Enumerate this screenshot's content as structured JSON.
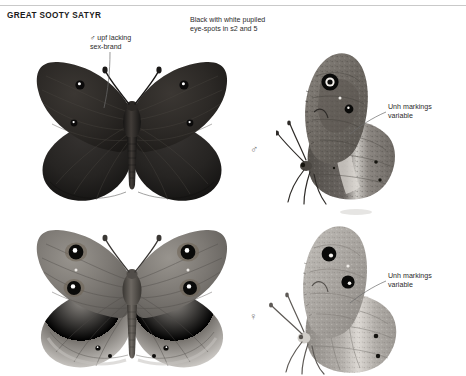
{
  "plate": {
    "title": "GREAT SOOTY SATYR",
    "background_color": "#ffffff",
    "rule_color": "#c9c9c9"
  },
  "annotations": [
    {
      "id": "upperside-eyespots",
      "text": "Black with white pupiled\neye-spots in s2 and 5",
      "has_leader": false
    },
    {
      "id": "sex-brand",
      "text": "♂ upf lacking\nsex-brand",
      "has_leader": true
    },
    {
      "id": "unh-variable-male",
      "text": "Unh markings\nvariable",
      "has_leader": true
    },
    {
      "id": "unh-variable-female",
      "text": "Unh markings\nvariable",
      "has_leader": true
    }
  ],
  "symbols": {
    "male": "♂",
    "female": "♀"
  },
  "specimens": [
    {
      "id": "male-upperside",
      "sex": "male",
      "view": "upperside",
      "wing_color": "#2a2724",
      "eyespot_count": 4,
      "eyespot_pupil_color": "#ffffff"
    },
    {
      "id": "male-underside",
      "sex": "male",
      "view": "underside-lateral",
      "wing_color": "#6e6a66",
      "eyespot_count": 2,
      "eyespot_pupil_color": "#ffffff"
    },
    {
      "id": "female-upperside",
      "sex": "female",
      "view": "upperside",
      "wing_color": "#77736e",
      "eyespot_count": 6,
      "eyespot_pupil_color": "#ffffff"
    },
    {
      "id": "female-underside",
      "sex": "female",
      "view": "underside-lateral",
      "wing_color": "#a9a6a1",
      "eyespot_count": 4,
      "eyespot_pupil_color": "#ffffff"
    }
  ]
}
